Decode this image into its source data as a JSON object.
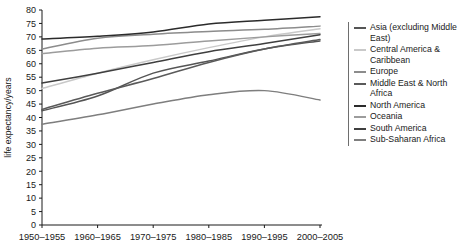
{
  "chart_data": {
    "type": "line",
    "title": "",
    "xlabel": "",
    "ylabel": "life expectancy/years",
    "ylim": [
      0,
      80
    ],
    "ytick_step": 5,
    "grid": false,
    "legend_position": "right",
    "categories": [
      "1950-1955",
      "1960-1965",
      "1970-1975",
      "1980-1985",
      "1990-1995",
      "2000-2005"
    ],
    "x": [
      1952.5,
      1962.5,
      1972.5,
      1982.5,
      1992.5,
      2002.5
    ],
    "yticks": [
      0,
      5,
      10,
      15,
      20,
      25,
      30,
      35,
      40,
      45,
      50,
      55,
      60,
      65,
      70,
      75,
      80
    ],
    "series": [
      {
        "name": "Asia (excluding Middle East)",
        "color": "#555555",
        "values": [
          42.5,
          48.0,
          56.5,
          61.0,
          65.5,
          68.5
        ]
      },
      {
        "name": "Central America & Caribbean",
        "color": "#c9c9c9",
        "values": [
          50.8,
          56.5,
          61.5,
          66.0,
          70.0,
          73.0
        ]
      },
      {
        "name": "Europe",
        "color": "#8c8c8c",
        "values": [
          65.5,
          69.5,
          71.0,
          72.0,
          72.8,
          74.0
        ]
      },
      {
        "name": "Middle East & North Africa",
        "color": "#5a5a5a",
        "values": [
          43.0,
          49.0,
          54.5,
          60.5,
          65.5,
          69.0
        ]
      },
      {
        "name": "North America",
        "color": "#2b2b2b",
        "values": [
          69.2,
          70.2,
          71.8,
          74.8,
          76.2,
          77.5
        ]
      },
      {
        "name": "Oceania",
        "color": "#9c9c9c",
        "values": [
          63.8,
          65.8,
          66.8,
          68.5,
          70.0,
          71.3
        ]
      },
      {
        "name": "South America",
        "color": "#3f3f3f",
        "values": [
          52.8,
          56.5,
          60.5,
          64.5,
          67.5,
          70.8
        ]
      },
      {
        "name": "Sub-Saharan Africa",
        "color": "#7e7e7e",
        "values": [
          37.5,
          41.0,
          45.0,
          48.5,
          50.0,
          46.5
        ]
      }
    ]
  }
}
